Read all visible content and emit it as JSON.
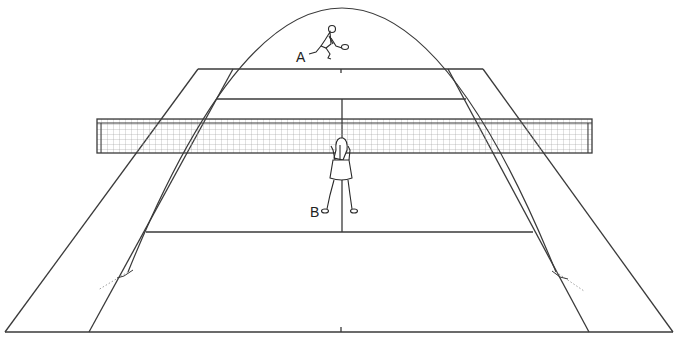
{
  "diagram": {
    "colors": {
      "line": "#3a3a3a",
      "net_mesh": "#9a9a9a",
      "background": "#ffffff",
      "trajectory_dotted": "#a0a0a0"
    },
    "players": [
      {
        "id": "A",
        "label": "A",
        "position": "far baseline, hitting lob"
      },
      {
        "id": "B",
        "label": "B",
        "position": "near side, standing at net facing away"
      }
    ],
    "court": {
      "far_baseline": {
        "y": 69,
        "x1": 198,
        "x2": 483
      },
      "far_singles": {
        "left": 233,
        "right": 448
      },
      "far_service_line": {
        "y": 99,
        "x1": 215,
        "x2": 469
      },
      "net": {
        "x1": 97,
        "x2": 592,
        "y_top": 119,
        "y_bottom": 153
      },
      "near_service_line": {
        "y": 232,
        "x1": 143,
        "x2": 535
      },
      "near_baseline": {
        "y": 332,
        "x1": 5,
        "x2": 673
      },
      "near_singles": {
        "left": 89,
        "right": 589
      },
      "center_line_x": 342
    },
    "trajectory": {
      "start": [
        128,
        272
      ],
      "peak": [
        342,
        8
      ],
      "end": [
        556,
        272
      ]
    }
  }
}
